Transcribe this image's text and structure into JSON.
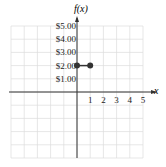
{
  "chart_data": {
    "type": "scatter",
    "title": "",
    "xlabel": "x",
    "ylabel": "f(x)",
    "x_ticks": [
      "1",
      "2",
      "3",
      "4",
      "5"
    ],
    "y_ticks": [
      "$1.00",
      "$2.00",
      "$3.00",
      "$4.00",
      "$5.00"
    ],
    "xlim": [
      -5,
      5
    ],
    "ylim": [
      -5,
      5
    ],
    "grid": true,
    "series": [
      {
        "name": "f(x)",
        "points": [
          [
            0,
            2
          ],
          [
            1,
            2
          ]
        ],
        "segment": true,
        "closed_endpoints": [
          true,
          true
        ]
      }
    ]
  },
  "labels": {
    "ylabel": "f(x)",
    "xlabel": "x"
  }
}
